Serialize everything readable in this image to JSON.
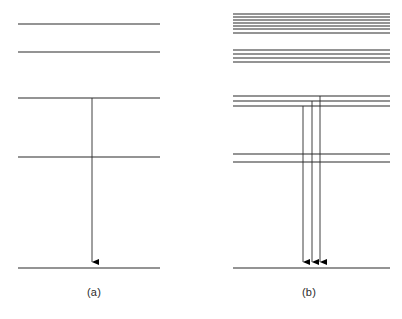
{
  "figure": {
    "width": 402,
    "height": 319,
    "background_color": "#ffffff",
    "line_color": "#2b2b2b",
    "arrow_color": "#000000"
  },
  "panels": [
    {
      "id": "a",
      "caption": "(a)",
      "x_start": 18,
      "x_end": 160,
      "levels": [
        {
          "name": "level-a-1",
          "y": 24,
          "lines": [
            24
          ]
        },
        {
          "name": "level-a-2",
          "y": 52,
          "lines": [
            52
          ]
        },
        {
          "name": "level-a-3",
          "y": 98,
          "lines": [
            98
          ]
        },
        {
          "name": "level-a-4",
          "y": 157,
          "lines": [
            157
          ]
        },
        {
          "name": "level-a-ground",
          "y": 268,
          "lines": [
            268
          ]
        }
      ],
      "transitions": [
        {
          "name": "transition-a-1",
          "x": 92,
          "y_from": 98,
          "y_to": 268,
          "direction": "down"
        }
      ]
    },
    {
      "id": "b",
      "caption": "(b)",
      "x_start": 233,
      "x_end": 390,
      "levels": [
        {
          "name": "level-b-1",
          "y": 24,
          "lines": [
            14,
            17,
            20,
            23,
            26,
            29,
            33
          ]
        },
        {
          "name": "level-b-2",
          "y": 56,
          "lines": [
            50,
            54,
            58,
            62
          ]
        },
        {
          "name": "level-b-3",
          "y": 100,
          "lines": [
            96,
            101,
            106
          ]
        },
        {
          "name": "level-b-4",
          "y": 158,
          "lines": [
            154,
            162
          ]
        },
        {
          "name": "level-b-ground",
          "y": 268,
          "lines": [
            268
          ]
        }
      ],
      "transitions": [
        {
          "name": "transition-b-1",
          "x": 303,
          "y_from": 106,
          "y_to": 268,
          "direction": "down"
        },
        {
          "name": "transition-b-2",
          "x": 312,
          "y_from": 101,
          "y_to": 268,
          "direction": "down"
        },
        {
          "name": "transition-b-3",
          "x": 320,
          "y_from": 96,
          "y_to": 268,
          "direction": "down"
        }
      ]
    }
  ]
}
